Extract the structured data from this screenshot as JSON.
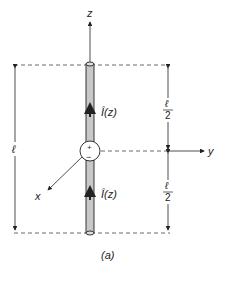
{
  "figure": {
    "caption": "(a)",
    "axes": {
      "z": "z",
      "y": "y",
      "x": "x"
    },
    "current_label_top": "Î(z)",
    "current_label_bottom": "Î(z)",
    "feed": {
      "plus": "+",
      "minus": "−"
    },
    "dimensions": {
      "total_length": "ℓ",
      "half_top_num": "ℓ",
      "half_top_den": "2",
      "half_bottom_num": "ℓ",
      "half_bottom_den": "2"
    },
    "colors": {
      "line": "#222222",
      "wire_fill": "#c8c8c8",
      "dash": "#444444"
    }
  }
}
